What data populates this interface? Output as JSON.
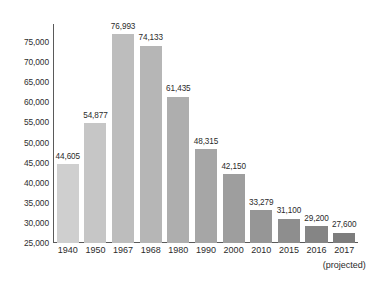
{
  "chart_data": {
    "type": "bar",
    "title": "",
    "subtitle": "",
    "xlabel": "",
    "ylabel": "",
    "categories": [
      "1940",
      "1950",
      "1967",
      "1968",
      "1980",
      "1990",
      "2000",
      "2010",
      "2015",
      "2016",
      "2017"
    ],
    "values": [
      44605,
      54877,
      76993,
      74133,
      61435,
      48315,
      42150,
      33279,
      31100,
      29200,
      27600
    ],
    "value_labels": [
      "44,605",
      "54,877",
      "76,993",
      "74,133",
      "61,435",
      "48,315",
      "42,150",
      "33,279",
      "31,100",
      "29,200",
      "27,600"
    ],
    "bar_colors": [
      "#cfcfcf",
      "#c6c6c6",
      "#bdbdbd",
      "#b6b6b6",
      "#aeaeae",
      "#a6a6a6",
      "#9e9e9e",
      "#969696",
      "#8e8e8e",
      "#858585",
      "#7d7d7d"
    ],
    "ylim": [
      25000,
      79500
    ],
    "ytick_labels": [
      "75,000",
      "70,000",
      "65,000",
      "60,000",
      "55,000",
      "50,000",
      "45,000",
      "40,000",
      "35,000",
      "30,000",
      "25,000"
    ],
    "ytick_values": [
      75000,
      70000,
      65000,
      60000,
      55000,
      50000,
      45000,
      40000,
      35000,
      30000,
      25000
    ],
    "grid": false,
    "legend": null,
    "annotations": [
      {
        "name": "projected-note",
        "text": "(projected)",
        "attached_to": "2017"
      }
    ],
    "axis_color": "#5a5a5a",
    "text_color": "#2b2b2b",
    "background_color": "#ffffff"
  }
}
